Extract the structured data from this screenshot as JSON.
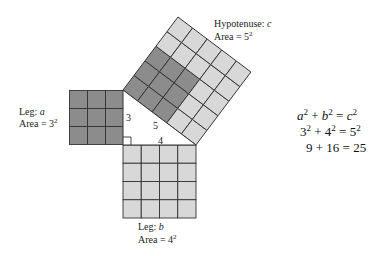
{
  "figure": {
    "colors": {
      "light_fill": "#d8d8d8",
      "dark_fill": "#8c8c8c",
      "grid_line": "#333333",
      "background": "#ffffff"
    },
    "triangle": {
      "side_a": "3",
      "side_b": "4",
      "side_c": "5"
    },
    "leg_a": {
      "label_prefix": "Leg: ",
      "label_var": "a",
      "area_prefix": "Area = 3",
      "area_exp": "2",
      "grid_n": 3,
      "fill": "dark"
    },
    "leg_b": {
      "label_prefix": "Leg: ",
      "label_var": "b",
      "area_prefix": "Area = 4",
      "area_exp": "2",
      "grid_n": 4,
      "fill": "light"
    },
    "hypotenuse": {
      "label_prefix": "Hypotenuse: ",
      "label_var": "c",
      "area_prefix": "Area = 5",
      "area_exp": "2",
      "grid_n": 5,
      "dark_cells_uv": [
        [
          0,
          0
        ],
        [
          1,
          0
        ],
        [
          2,
          0
        ],
        [
          0,
          1
        ],
        [
          1,
          1
        ],
        [
          2,
          1
        ],
        [
          0,
          2
        ],
        [
          1,
          2
        ],
        [
          2,
          2
        ]
      ]
    }
  },
  "equations": {
    "line1": {
      "a": "a",
      "a_exp": "2",
      "plus": " + ",
      "b": "b",
      "b_exp": "2",
      "eq": " = ",
      "c": "c",
      "c_exp": "2"
    },
    "line2": {
      "a": "3",
      "a_exp": "2",
      "plus": " + ",
      "b": "4",
      "b_exp": "2",
      "eq": " = ",
      "c": "5",
      "c_exp": "2"
    },
    "line3": {
      "text": "9 + 16 = 25"
    }
  }
}
